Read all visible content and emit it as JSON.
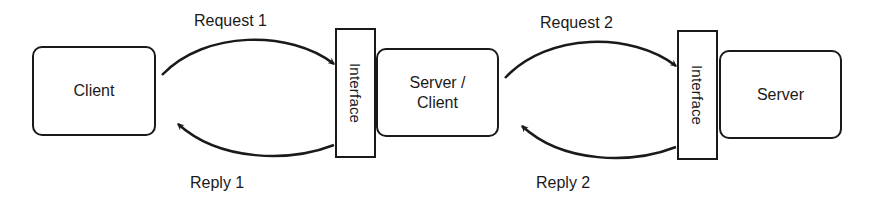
{
  "diagram": {
    "nodes": [
      {
        "id": "client",
        "label": "Client"
      },
      {
        "id": "interface1",
        "label": "Interface"
      },
      {
        "id": "server_client",
        "label_line1": "Server /",
        "label_line2": "Client"
      },
      {
        "id": "interface2",
        "label": "Interface"
      },
      {
        "id": "server",
        "label": "Server"
      }
    ],
    "edges": [
      {
        "from": "client",
        "to": "interface1",
        "label": "Request 1"
      },
      {
        "from": "interface1",
        "to": "client",
        "label": "Reply 1"
      },
      {
        "from": "server_client",
        "to": "interface2",
        "label": "Request 2"
      },
      {
        "from": "interface2",
        "to": "server_client",
        "label": "Reply 2"
      }
    ],
    "colors": {
      "stroke": "#1a1a1a",
      "background": "#ffffff"
    }
  }
}
